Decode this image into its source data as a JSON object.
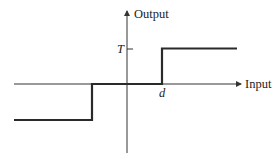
{
  "diagram": {
    "type": "step-function (ideal relay with dead zone)",
    "axes": {
      "x_label": "Input",
      "y_label": "Output"
    },
    "annotations": {
      "threshold_output": "T",
      "threshold_input": "d"
    },
    "colors": {
      "line": "#2a2a2a",
      "axis": "#333333",
      "background": "#ffffff"
    }
  }
}
